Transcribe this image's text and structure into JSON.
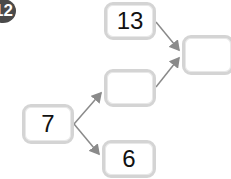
{
  "problem_number": "12",
  "boxes": {
    "top": "13",
    "middle": "",
    "right": "",
    "start": "7",
    "bottom": "6"
  },
  "colors": {
    "box_border": "#d4d4d4",
    "arrow": "#8a8a8a",
    "badge": "#4a4a4a"
  }
}
